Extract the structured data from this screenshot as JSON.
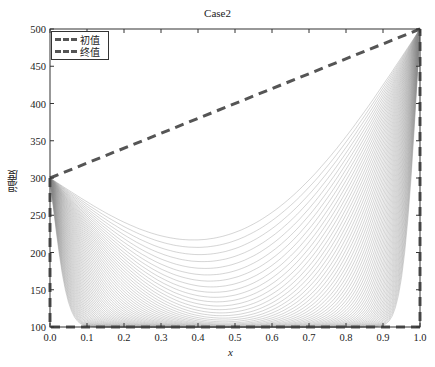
{
  "chart_data": {
    "type": "line",
    "title": "Case2",
    "xlabel": "x",
    "ylabel": "温度",
    "xlim": [
      0.0,
      1.0
    ],
    "ylim": [
      100,
      500
    ],
    "xticks": [
      "0.0",
      "0.1",
      "0.2",
      "0.3",
      "0.4",
      "0.5",
      "0.6",
      "0.7",
      "0.8",
      "0.9",
      "1.0"
    ],
    "yticks": [
      "100",
      "150",
      "200",
      "250",
      "300",
      "350",
      "400",
      "450",
      "500"
    ],
    "grid": false,
    "legend_position": "upper-left",
    "series": [
      {
        "name": "初值",
        "style": "dashed",
        "color": "#555555",
        "x": [
          0.0,
          0.0,
          1.0,
          1.0
        ],
        "y": [
          300,
          100,
          100,
          500
        ],
        "note": "initial condition: 100 in interior, boundary 300 at x=0 and 500 at x=1"
      },
      {
        "name": "终值",
        "style": "dashed",
        "color": "#555555",
        "x": [
          0.0,
          1.0
        ],
        "y": [
          300,
          500
        ],
        "note": "final steady state: linear from 300 to 500"
      }
    ],
    "transient_curves": {
      "count": 60,
      "color": "#888888",
      "description": "family of thin solid temperature profiles evolving from initial value toward steady linear profile; minimum near x≈0.5",
      "boundary_left": 300,
      "boundary_right": 500,
      "initial_interior": 100
    }
  },
  "legend": {
    "items": [
      {
        "label": "初值"
      },
      {
        "label": "终值"
      }
    ]
  }
}
